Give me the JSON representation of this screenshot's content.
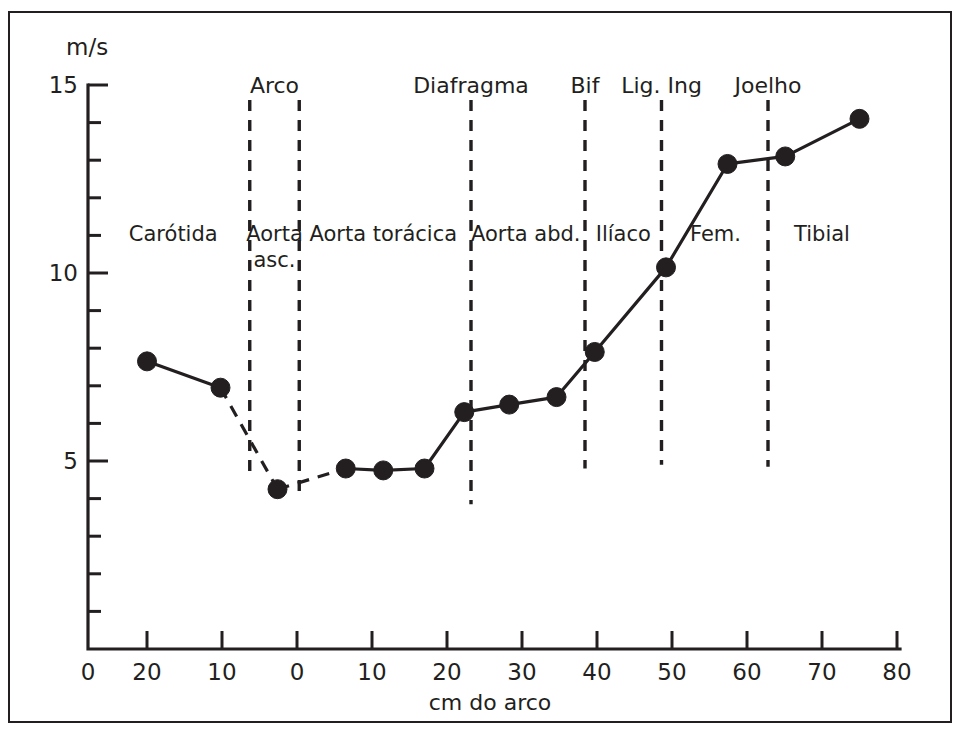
{
  "figure": {
    "border_color": "#231f20",
    "ink_color": "#231f20",
    "y_unit_label": "m/s",
    "x_axis_title": "cm do arco"
  },
  "chart_data": {
    "type": "line",
    "title": "",
    "subtitle": "",
    "xlabel": "cm do arco",
    "ylabel": "m/s",
    "xlim": [
      -28,
      80
    ],
    "ylim": [
      0,
      15
    ],
    "grid": false,
    "legend": "none",
    "x_tick_labels": [
      "0",
      "20",
      "10",
      "0",
      "10",
      "20",
      "30",
      "40",
      "50",
      "60",
      "70",
      "80"
    ],
    "x_tick_values": [
      -28,
      -20,
      -10,
      0,
      10,
      20,
      30,
      40,
      50,
      60,
      70,
      80
    ],
    "y_tick_labels": [
      "5",
      "10",
      "15"
    ],
    "y_tick_values": [
      5,
      10,
      15
    ],
    "y_minor_step": 1,
    "series": [
      {
        "name": "Velocidade de onda de pulso",
        "x": [
          -20.0,
          -10.2,
          -2.6,
          6.5,
          11.5,
          17.0,
          22.3,
          28.3,
          34.6,
          39.7,
          49.2,
          57.4,
          65.1,
          75.0
        ],
        "values": [
          7.65,
          6.95,
          4.25,
          4.8,
          4.75,
          4.8,
          6.3,
          6.5,
          6.7,
          7.9,
          10.15,
          12.9,
          13.1,
          14.1
        ],
        "segment_styles": [
          "solid",
          "dashed",
          "dashed",
          "solid",
          "solid",
          "solid",
          "solid",
          "solid",
          "solid",
          "solid",
          "solid",
          "solid",
          "solid"
        ]
      }
    ],
    "dividers": [
      {
        "name": "arco-start-divider",
        "x": -6.3,
        "top_value": 14.6,
        "bottom_value": 4.55
      },
      {
        "name": "arco-end-divider",
        "x": 0.3,
        "top_value": 14.6,
        "bottom_value": 4.0
      },
      {
        "name": "diafragma-divider",
        "x": 23.2,
        "top_value": 14.6,
        "bottom_value": 3.85
      },
      {
        "name": "bif-divider",
        "x": 38.4,
        "top_value": 14.6,
        "bottom_value": 4.8
      },
      {
        "name": "lig-ing-divider",
        "x": 48.6,
        "top_value": 14.6,
        "bottom_value": 4.9
      },
      {
        "name": "joelho-divider",
        "x": 62.8,
        "top_value": 14.6,
        "bottom_value": 4.85
      }
    ],
    "annotations_top": [
      {
        "label": "Arco",
        "x": -3.0
      },
      {
        "label": "Diafragma",
        "x": 23.2
      },
      {
        "label": "Bif",
        "x": 38.4
      },
      {
        "label": "Lig. Ing",
        "x": 48.6
      },
      {
        "label": "Joelho",
        "x": 62.8
      }
    ],
    "annotations_regions": [
      {
        "label": "Carótida",
        "x": -16.5,
        "value": 10.85
      },
      {
        "label": "Aorta",
        "x": -3.0,
        "value": 10.85
      },
      {
        "label": "asc.",
        "x": -3.0,
        "value": 10.15
      },
      {
        "label": "Aorta torácica",
        "x": 11.5,
        "value": 10.85
      },
      {
        "label": "Aorta abd.",
        "x": 30.5,
        "value": 10.85
      },
      {
        "label": "Ilíaco",
        "x": 43.5,
        "value": 10.85
      },
      {
        "label": "Fem.",
        "x": 55.8,
        "value": 10.85
      },
      {
        "label": "Tibial",
        "x": 70.0,
        "value": 10.85
      }
    ]
  }
}
